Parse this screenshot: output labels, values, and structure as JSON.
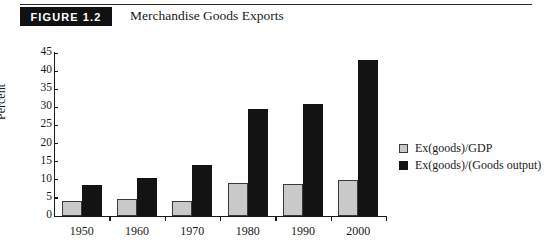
{
  "header": {
    "badge_label": "FIGURE 1.2",
    "title": "Merchandise Goods Exports"
  },
  "legend": {
    "position": "right",
    "entries": [
      {
        "label": "Ex(goods)/GDP",
        "color": "#c9c9c9",
        "swatch": "square-outline-icon"
      },
      {
        "label": "Ex(goods)/(Goods output)",
        "color": "#131313",
        "swatch": "square-filled-icon"
      }
    ]
  },
  "chart_data": {
    "type": "bar",
    "title": "Merchandise Goods Exports",
    "xlabel": "",
    "ylabel": "Percent",
    "categories": [
      "1950",
      "1960",
      "1970",
      "1980",
      "1990",
      "2000"
    ],
    "series": [
      {
        "name": "Ex(goods)/GDP",
        "color": "#c9c9c9",
        "values": [
          4.2,
          4.6,
          4.1,
          9.1,
          8.9,
          10.0
        ]
      },
      {
        "name": "Ex(goods)/(Goods output)",
        "color": "#131313",
        "values": [
          8.5,
          10.6,
          14.2,
          29.5,
          31.0,
          43.0
        ]
      }
    ],
    "ylim": [
      0,
      45
    ],
    "yticks": [
      0,
      5,
      10,
      15,
      20,
      25,
      30,
      35,
      40,
      45
    ],
    "ytick_labels": [
      "0",
      "5",
      "10",
      "15",
      "20",
      "25",
      "30",
      "35",
      "40",
      "45"
    ],
    "grid": false
  }
}
